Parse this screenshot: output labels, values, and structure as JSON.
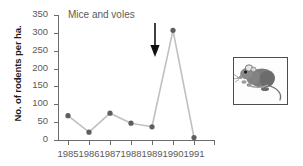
{
  "chart_data": {
    "type": "line",
    "title": "Mice and voles",
    "xlabel": "",
    "ylabel": "No. of rodents per ha.",
    "categories": [
      "1985",
      "1986",
      "1987",
      "1988",
      "1989",
      "1990",
      "1991"
    ],
    "values": [
      68,
      22,
      75,
      47,
      37,
      307,
      7
    ],
    "ylim": [
      0,
      350
    ],
    "yticks": [
      0,
      50,
      100,
      150,
      200,
      250,
      300,
      350
    ],
    "ytick_labels": [
      "0",
      "50",
      "100",
      "150",
      "200",
      "250",
      "300",
      "350"
    ],
    "grid": false,
    "legend": "none",
    "series": [
      {
        "name": "Mice and voles",
        "values": [
          68,
          22,
          75,
          47,
          37,
          307,
          7
        ]
      }
    ],
    "annotations": [
      {
        "type": "arrow",
        "direction": "down",
        "at_category": "1989",
        "label": ""
      }
    ],
    "colors": {
      "line": "#c0c0c0",
      "marker": "#5e5e5e",
      "axis": "#6b6b6b",
      "text": "#5a5a5a",
      "axis_title": "#1c1c1c",
      "arrow": "#101010",
      "mouse_body": "#7b7b7b",
      "mouse_border": "#4d4d4d",
      "background": "#ffffff"
    }
  },
  "illustration": {
    "name": "wood-mouse-illustration",
    "caption": ""
  }
}
